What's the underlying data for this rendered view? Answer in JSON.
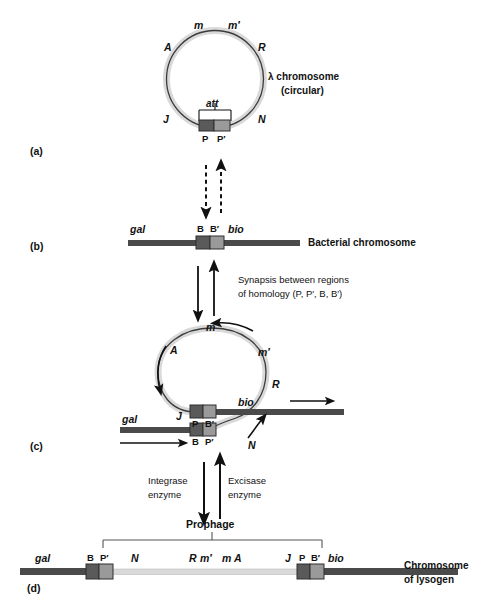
{
  "figure": {
    "colors": {
      "phage_dna": "#d9d9d9",
      "phage_outline": "#3b3b3b",
      "bacterial_dna": "#4a4a4a",
      "box_dark": "#5a5a5a",
      "box_light": "#9a9a9a",
      "arrow": "#111111",
      "text": "#111111",
      "background": "#ffffff"
    }
  },
  "panels": {
    "a": {
      "label": "(a)",
      "caption_line1": "λ chromosome",
      "caption_line2": "(circular)",
      "att_label": "att",
      "genes": {
        "m": "m",
        "m_prime": "m′",
        "A": "A",
        "R": "R",
        "J": "J",
        "N": "N"
      },
      "sites": {
        "P": "P",
        "P_prime": "P′"
      }
    },
    "b": {
      "label": "(b)",
      "caption": "Bacterial chromosome",
      "genes": {
        "gal": "gal",
        "bio": "bio"
      },
      "sites": {
        "B": "B",
        "B_prime": "B′"
      }
    },
    "c": {
      "label": "(c)",
      "genes": {
        "m": "m",
        "m_prime": "m′",
        "A": "A",
        "R": "R",
        "J": "J",
        "N": "N",
        "gal": "gal",
        "bio": "bio"
      },
      "sites": {
        "top_left": "P",
        "top_right": "B′",
        "bottom_left": "B",
        "bottom_right": "P′"
      }
    },
    "d": {
      "label": "(d)",
      "prophage_label": "Prophage",
      "caption_line1": "Chromosome",
      "caption_line2": "of lysogen",
      "genes": {
        "gal": "gal",
        "N": "N",
        "R": "R",
        "m_prime": "m′",
        "m": "m",
        "A": "A",
        "J": "J",
        "bio": "bio"
      },
      "sites": {
        "B": "B",
        "P_prime": "P′",
        "P": "P",
        "B_prime": "B′"
      }
    }
  },
  "annotations": {
    "synapsis_line1": "Synapsis between regions",
    "synapsis_line2": "of  homology (P, P′, B, B′)",
    "integrase_line1": "Integrase",
    "integrase_line2": "enzyme",
    "excisase_line1": "Excisase",
    "excisase_line2": "enzyme"
  }
}
